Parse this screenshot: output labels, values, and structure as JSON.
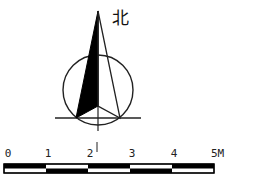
{
  "diagram": {
    "type": "north-arrow-with-scale-bar",
    "north_arrow": {
      "label": "北",
      "meaning": "North"
    },
    "scale_bar": {
      "ticks": [
        "0",
        "1",
        "2",
        "3",
        "4"
      ],
      "end_label": "5M",
      "unit": "M",
      "segments": 5
    },
    "colors": {
      "ink": "#111111",
      "background": "#ffffff"
    }
  }
}
